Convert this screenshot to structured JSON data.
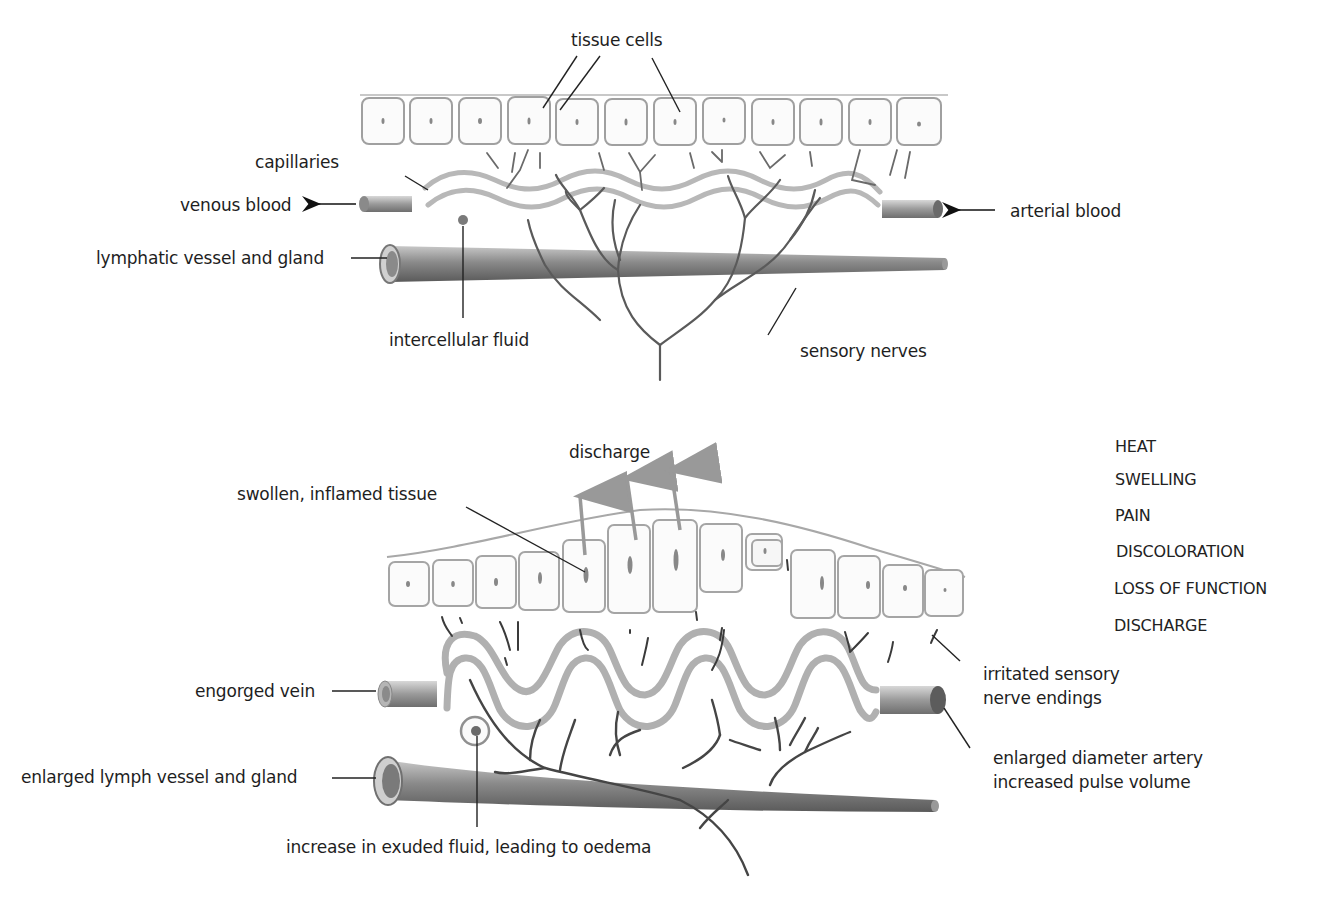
{
  "diagram": {
    "top_panel": {
      "name": "normal tissue",
      "labels": {
        "tissue_cells": "tissue cells",
        "capillaries": "capillaries",
        "venous_blood": "venous blood",
        "arterial_blood": "arterial blood",
        "lymphatic_vessel": "lymphatic vessel and gland",
        "intercellular_fluid": "intercellular fluid",
        "sensory_nerves": "sensory nerves"
      }
    },
    "bottom_panel": {
      "name": "inflamed tissue",
      "labels": {
        "discharge": "discharge",
        "swollen_tissue": "swollen, inflamed tissue",
        "engorged_vein": "engorged vein",
        "enlarged_lymph": "enlarged lymph vessel and gland",
        "exuded_fluid": "increase in exuded fluid, leading to oedema",
        "irritated_nerves_1": "irritated sensory",
        "irritated_nerves_2": "nerve endings",
        "enlarged_artery_1": "enlarged diameter artery",
        "enlarged_artery_2": "increased pulse volume"
      }
    },
    "signs_of_inflammation": [
      "HEAT",
      "SWELLING",
      "PAIN",
      "DISCOLORATION",
      "LOSS OF FUNCTION",
      "DISCHARGE"
    ],
    "colors": {
      "ink": "#1e1e1e",
      "cell_outline": "#9a9a9a",
      "vessel_gray": "#8c8c8c",
      "nerve": "#555555",
      "capillary": "#b5b5b5"
    }
  }
}
